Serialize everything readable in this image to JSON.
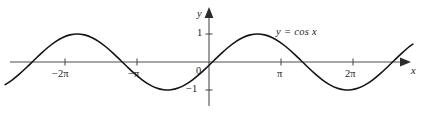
{
  "figure": {
    "background_color": "#ffffff",
    "width": 425,
    "height": 114,
    "curve_color": "#141414",
    "axis_color": "#4f4f4f"
  },
  "labels": {
    "y_axis_name": "y",
    "x_axis_name": "x",
    "equation": "y = cos x",
    "origin": "0",
    "y_one": "1",
    "y_neg_one": "−1",
    "x_neg_two_pi": "−2π",
    "x_neg_pi": "−π",
    "x_pi": "π",
    "x_two_pi": "2π"
  },
  "chart_data": {
    "type": "line",
    "title": "",
    "subtitle": "",
    "xlabel": "x",
    "ylabel": "y",
    "function": "y = cos x",
    "annotations": [
      "y = cos x"
    ],
    "legend": [],
    "legend_position": "none",
    "grid": false,
    "axis_arrows": {
      "x_right": true,
      "y_top": true
    },
    "xlim": [
      -2.8318,
      2.8318
    ],
    "ylim": [
      -1.45,
      1.45
    ],
    "xlim_pi_units": [
      -2.8318,
      2.8318
    ],
    "xticks": [
      -6.28319,
      -3.14159,
      0,
      3.14159,
      6.28319
    ],
    "xticklabels": [
      "−2π",
      "−π",
      "0",
      "π",
      "2π"
    ],
    "yticks": [
      -1,
      0,
      1
    ],
    "yticklabels": [
      "−1",
      "0",
      "1"
    ],
    "series": [
      {
        "name": "y = cos x",
        "color": "#141414",
        "x_domain_radians": [
          -8.895,
          8.895
        ],
        "x": [
          -8.8949,
          -8.5803,
          -8.2658,
          -7.9512,
          -7.6367,
          -7.3221,
          -7.0076,
          -6.693,
          -6.3785,
          -6.0639,
          -5.7494,
          -5.4348,
          -5.1203,
          -4.8057,
          -4.4912,
          -4.1766,
          -3.8621,
          -3.5475,
          -3.233,
          -2.9184,
          -2.6039,
          -2.2893,
          -1.9748,
          -1.6602,
          -1.3457,
          -1.0311,
          -0.7166,
          -0.402,
          -0.0875,
          0.2271,
          0.5416,
          0.8562,
          1.1707,
          1.4853,
          1.7998,
          2.1144,
          2.4289,
          2.7435,
          3.058,
          3.3726,
          3.6871,
          4.0017,
          4.3162,
          4.6308,
          4.9453,
          5.2599,
          5.5744,
          5.889,
          6.2035,
          6.5181,
          6.8326,
          7.1472,
          7.4617,
          7.7763,
          8.0908,
          8.4054,
          8.7199,
          8.8949
        ],
        "y": [
          -0.809,
          -0.6374,
          -0.4258,
          -0.1874,
          0.0628,
          0.309,
          0.5358,
          0.729,
          0.8763,
          0.9686,
          1.0,
          0.9686,
          0.8763,
          0.729,
          0.5358,
          0.309,
          0.0628,
          -0.1874,
          -0.4258,
          -0.6374,
          -0.809,
          -0.9298,
          -0.9921,
          -0.9921,
          -0.9298,
          -0.809,
          -0.6374,
          -0.4258,
          -0.1874,
          0.0628,
          0.309,
          0.5358,
          0.729,
          0.8763,
          0.9686,
          1.0,
          0.9686,
          0.8763,
          0.729,
          0.5358,
          0.309,
          0.0628,
          -0.1874,
          -0.4258,
          -0.6374,
          -0.809,
          -0.9298,
          -0.9921,
          -0.9921,
          -0.9298,
          -0.809,
          -0.6374,
          -0.4258,
          -0.1874,
          0.0628,
          0.309,
          0.5358,
          0.6374
        ]
      }
    ],
    "maxima_at": [
      "−2π",
      "0",
      "2π"
    ],
    "minima_at": [
      "−π",
      "π"
    ],
    "amplitude": 1,
    "period": "2π"
  }
}
